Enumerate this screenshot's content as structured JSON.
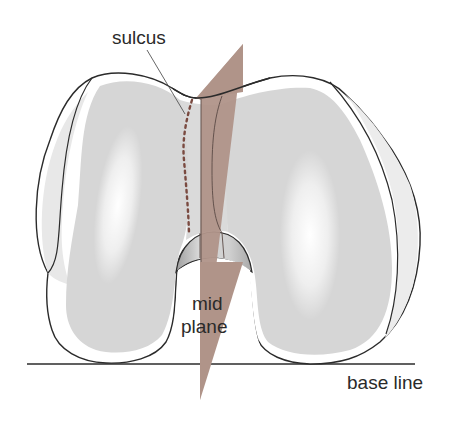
{
  "diagram": {
    "labels": {
      "sulcus": "sulcus",
      "mid_plane_line1": "mid",
      "mid_plane_line2": "plane",
      "base_line": "base line"
    },
    "colors": {
      "outline": "#2b2b2b",
      "cartilage_fill": "#d9d9d9",
      "bone_rim": "#ffffff",
      "plane_fill": "#b09489",
      "sulcus_dots": "#7a4a40",
      "notch_shade": "#bdbdbd",
      "highlight": "#ffffff"
    }
  }
}
